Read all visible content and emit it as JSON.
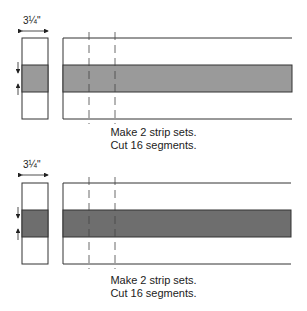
{
  "diagrams": [
    {
      "dimension_label": "3¼\"",
      "band_color": "#9a9a9a",
      "caption_line1": "Make 2 strip sets.",
      "caption_line2": "Cut 16 segments."
    },
    {
      "dimension_label": "3¼\"",
      "band_color": "#6e6e6e",
      "caption_line1": "Make 2 strip sets.",
      "caption_line2": "Cut 16 segments."
    }
  ]
}
